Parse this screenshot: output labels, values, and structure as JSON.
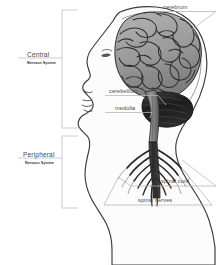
{
  "diagram": {
    "background_color": "#ffffff",
    "line_color": "#b9b9b9",
    "text_color": "#4a4a4a",
    "outline_color": "#3a3a3a",
    "cerebrum_fill": "#9a9a9a",
    "cerebellum_fill": "#232323",
    "skin_fill": "#fbfbfb"
  },
  "brackets": [
    {
      "id": "central",
      "label": "Central",
      "sublabel": "Nervous System",
      "top": 10,
      "bottom": 128,
      "leader_y": 58
    },
    {
      "id": "peripheral",
      "label": "Peripheral",
      "sublabel": "Nervous System",
      "top": 136,
      "bottom": 208,
      "leader_y": 158
    }
  ],
  "part_labels": [
    {
      "id": "cerebrum",
      "label": "cerebrum"
    },
    {
      "id": "cerebellum",
      "label": "cerebellum"
    },
    {
      "id": "medulla",
      "label": "medulla"
    },
    {
      "id": "spinal-cord",
      "label": "spinal cord"
    },
    {
      "id": "spinal-nerves",
      "label": "spinal nerves"
    }
  ]
}
